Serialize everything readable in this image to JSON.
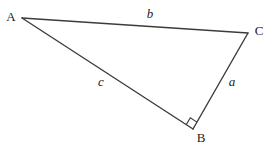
{
  "figure": {
    "background_color": "#ffffff",
    "line_color": "#3c3c3c",
    "line_width": 1.4,
    "label_color": "#1c1c1c",
    "width": 271,
    "height": 147,
    "vertices": {
      "A": {
        "label": "A",
        "x": 22,
        "y": 18,
        "label_x": 11,
        "label_y": 21
      },
      "B": {
        "label": "B",
        "x": 193,
        "y": 129,
        "label_x": 201,
        "label_y": 142
      },
      "C": {
        "label": "C",
        "x": 248,
        "y": 33,
        "label_x": 259,
        "label_y": 35
      }
    },
    "sides": {
      "b": {
        "label": "b",
        "from": "A",
        "to": "C",
        "label_x": 150,
        "label_y": 18
      },
      "c": {
        "label": "c",
        "from": "A",
        "to": "B",
        "label_x": 101,
        "label_y": 86
      },
      "a": {
        "label": "a",
        "from": "B",
        "to": "C",
        "label_x": 232,
        "label_y": 86
      }
    },
    "right_angle": {
      "at_vertex": "B",
      "size": 8
    }
  }
}
